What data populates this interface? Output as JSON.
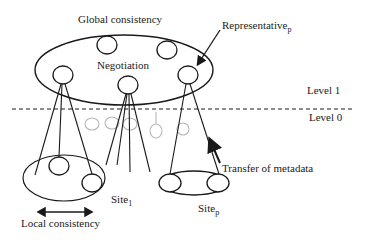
{
  "diagram": {
    "labels": {
      "global_consistency": "Global consistency",
      "negotiation": "Negotiation",
      "representative": "Representative",
      "representative_sub": "p",
      "level1": "Level 1",
      "level0": "Level 0",
      "transfer": "Transfer of metadata",
      "site1": "Site",
      "site1_sub": "1",
      "sitep": "Site",
      "sitep_sub": "p",
      "local_consistency": "Local consistency"
    },
    "colors": {
      "stroke": "#1a1a1a",
      "faded": "#b8b8b8",
      "background": "#ffffff"
    }
  }
}
